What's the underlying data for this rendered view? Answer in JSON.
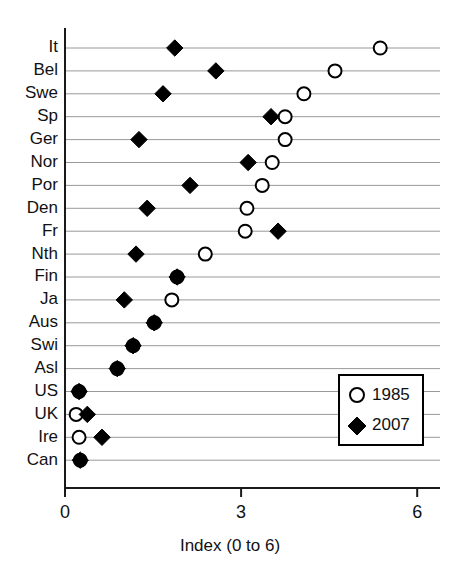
{
  "chart_data": {
    "type": "scatter",
    "title": "",
    "subtitle": "",
    "xlabel": "Index (0 to 6)",
    "ylabel": "",
    "xlim": [
      0,
      6.4
    ],
    "xticks": [
      0,
      3,
      6
    ],
    "xtick_labels": [
      "0",
      "3",
      "6"
    ],
    "grid": true,
    "grid_axis": "y",
    "legend_position": "bottom-right",
    "orientation": "horizontal-dot-plot",
    "categories": [
      "It",
      "Bel",
      "Swe",
      "Sp",
      "Ger",
      "Nor",
      "Por",
      "Den",
      "Fr",
      "Nth",
      "Fin",
      "Ja",
      "Aus",
      "Swi",
      "Asl",
      "US",
      "UK",
      "Ire",
      "Can"
    ],
    "series": [
      {
        "name": "1985",
        "marker": "open-circle",
        "color": "#000000",
        "values": [
          5.37,
          4.6,
          4.07,
          3.75,
          3.75,
          3.53,
          3.36,
          3.1,
          3.07,
          2.39,
          1.91,
          1.82,
          1.52,
          1.16,
          0.89,
          0.24,
          0.19,
          0.24,
          0.26
        ]
      },
      {
        "name": "2007",
        "marker": "filled-diamond",
        "color": "#000000",
        "values": [
          1.87,
          2.57,
          1.67,
          3.51,
          1.26,
          3.12,
          2.13,
          1.4,
          3.63,
          1.21,
          1.91,
          1.01,
          1.52,
          1.16,
          0.89,
          0.24,
          0.38,
          0.63,
          0.26
        ]
      }
    ]
  },
  "axis": {
    "x_title": "Index (0 to 6)",
    "tick_0": "0",
    "tick_3": "3",
    "tick_6": "6"
  },
  "legend": {
    "entries": [
      {
        "label": "1985",
        "marker": "open-circle"
      },
      {
        "label": "2007",
        "marker": "filled-diamond"
      }
    ]
  },
  "colors": {
    "background": "#ffffff",
    "ink": "#000000",
    "gridline": "#8d8d8d"
  }
}
